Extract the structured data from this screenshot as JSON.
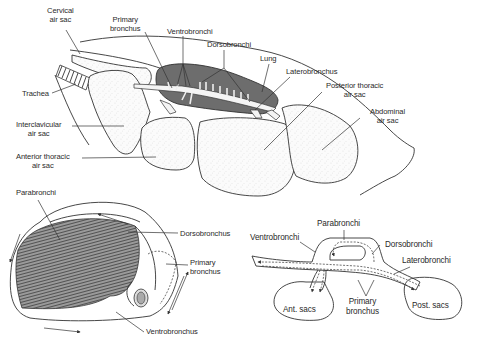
{
  "figure": {
    "panels": [
      {
        "id": "top",
        "description": "Lateral view of bird lungs and air sacs",
        "labels": {
          "cervical_air_sac": [
            "Cervical",
            "air sac"
          ],
          "primary_bronchus": [
            "Primary",
            "bronchus"
          ],
          "ventrobronchi": "Ventrobronchi",
          "dorsobronchi": "Dorsobronchi",
          "lung": "Lung",
          "laterobronchus": "Laterobronchus",
          "posterior_thoracic_air_sac": [
            "Posterior thoracic",
            "air sac"
          ],
          "abdominal_air_sac": [
            "Abdominal",
            "air sac"
          ],
          "trachea": "Trachea",
          "interclavicular_air_sac": [
            "Interclavicular",
            "air sac"
          ],
          "anterior_thoracic_air_sac": [
            "Anterior thoracic",
            "air sac"
          ]
        }
      },
      {
        "id": "bottom-left",
        "description": "Cutaway of lung showing parabronchi",
        "labels": {
          "parabronchi": "Parabronchi",
          "dorsobronchus": "Dorsobronchus",
          "primary_bronchus": [
            "Primary",
            "bronchus"
          ],
          "ventrobronchus": "Ventrobronchus"
        }
      },
      {
        "id": "bottom-right",
        "description": "Schematic of airflow through bronchi and sacs",
        "labels": {
          "parabronchi": "Parabronchi",
          "ventrobronchi": "Ventrobronchi",
          "dorsobronchi": "Dorsobronchi",
          "laterobronchi": "Laterobronchi",
          "ant_sacs": "Ant. sacs",
          "primary_bronchus": [
            "Primary",
            "bronchus"
          ],
          "post_sacs": "Post. sacs"
        }
      }
    ]
  },
  "colors": {
    "lung_fill": "#6d6d6d",
    "line": "#333333",
    "background": "#ffffff"
  }
}
